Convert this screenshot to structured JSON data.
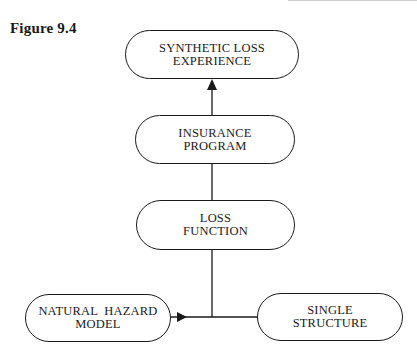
{
  "figure": {
    "caption": "Figure 9.4"
  },
  "nodes": {
    "synthetic_loss": {
      "line1": "SYNTHETIC LOSS",
      "line2": "EXPERIENCE"
    },
    "insurance_program": {
      "line1": "INSURANCE",
      "line2": "PROGRAM"
    },
    "loss_function": {
      "line1": "LOSS",
      "line2": "FUNCTION"
    },
    "natural_hazard": {
      "line1": "NATURAL  HAZARD",
      "line2": "MODEL"
    },
    "single_structure": {
      "line1": "SINGLE",
      "line2": "STRUCTURE"
    }
  },
  "edges": [
    {
      "from": "natural_hazard",
      "to": "junction",
      "arrow": true
    },
    {
      "from": "single_structure",
      "to": "junction",
      "arrow": false
    },
    {
      "from": "junction",
      "to": "loss_function",
      "arrow": false
    },
    {
      "from": "loss_function",
      "to": "insurance_program",
      "arrow": false
    },
    {
      "from": "insurance_program",
      "to": "synthetic_loss",
      "arrow": true
    }
  ],
  "colors": {
    "line": "#1a1a1a",
    "background": "#ffffff"
  }
}
